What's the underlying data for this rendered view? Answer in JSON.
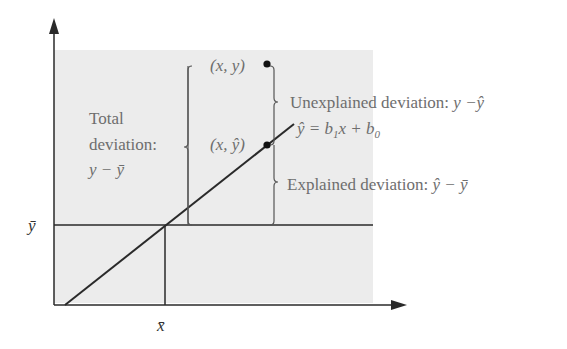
{
  "diagram": {
    "labels": {
      "point_observed": "(x, y)",
      "point_predicted": "(x, ŷ)",
      "total_line1": "Total",
      "total_line2": "deviation:",
      "total_line3": "y − ȳ",
      "unexplained": "Unexplained deviation: ",
      "unexplained_expr": "y −ŷ",
      "explained": "Explained deviation: ",
      "explained_expr": "ŷ − ȳ",
      "regression_eq": "ŷ = b",
      "regression_sub1": "1",
      "regression_mid": "x + b",
      "regression_sub0": "0",
      "ybar": "ȳ",
      "xbar": "x̄"
    },
    "colors": {
      "shade": "#ececec",
      "line": "#2a2a2a",
      "brace": "#555555",
      "text": "#6e6e6e"
    }
  }
}
